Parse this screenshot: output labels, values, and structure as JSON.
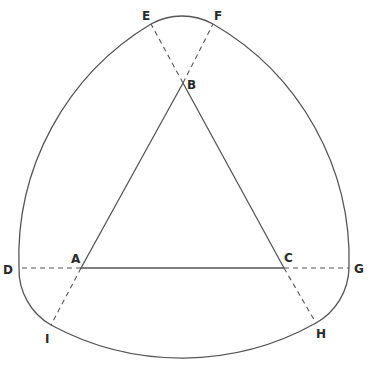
{
  "diagram": {
    "type": "geometric-construction",
    "colors": {
      "stroke": "#555555",
      "label": "#2a2a2a",
      "background": "#ffffff"
    },
    "points": {
      "A": {
        "label": "A",
        "x": 81,
        "y": 268
      },
      "B": {
        "label": "B",
        "x": 183,
        "y": 83
      },
      "C": {
        "label": "C",
        "x": 284,
        "y": 268
      },
      "D": {
        "label": "D",
        "x": 19,
        "y": 268
      },
      "E": {
        "label": "E",
        "x": 151,
        "y": 24
      },
      "F": {
        "label": "F",
        "x": 213,
        "y": 24
      },
      "G": {
        "label": "G",
        "x": 349,
        "y": 268
      },
      "H": {
        "label": "H",
        "x": 316,
        "y": 323
      },
      "I": {
        "label": "I",
        "x": 51,
        "y": 325
      }
    },
    "triangle": [
      "A",
      "B",
      "C"
    ],
    "dashed_extensions": [
      [
        "A",
        "D"
      ],
      [
        "C",
        "G"
      ],
      [
        "B",
        "E"
      ],
      [
        "B",
        "F"
      ],
      [
        "A",
        "I"
      ],
      [
        "C",
        "H"
      ]
    ],
    "arcs": [
      {
        "from": "E",
        "to": "F",
        "center": "B"
      },
      {
        "from": "F",
        "to": "G",
        "center": "A"
      },
      {
        "from": "G",
        "to": "H",
        "center": "C"
      },
      {
        "from": "H",
        "to": "I",
        "center": "B"
      },
      {
        "from": "I",
        "to": "D",
        "center": "A"
      },
      {
        "from": "D",
        "to": "E",
        "center": "C"
      }
    ]
  }
}
